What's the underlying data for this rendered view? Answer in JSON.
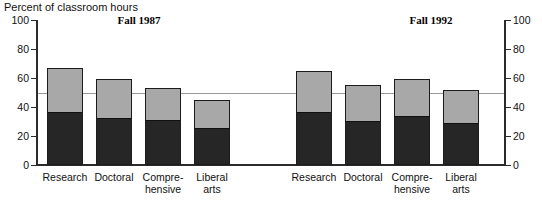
{
  "chart_data": {
    "type": "bar",
    "title": "",
    "subtitle": "",
    "ylabel": "Percent of classroom hours",
    "xlabel": "",
    "ylim": [
      0,
      100
    ],
    "yticks": [
      0,
      20,
      40,
      60,
      80,
      100
    ],
    "ytick_labels": [
      "0",
      "20",
      "40",
      "60",
      "80",
      "100"
    ],
    "gridlines": [
      50
    ],
    "grid": true,
    "dual_axis": true,
    "stacked": true,
    "legend_position": "none",
    "categories": [
      "Research",
      "Doctoral",
      "Compre-\nhensive",
      "Liberal\narts"
    ],
    "panels": [
      {
        "name": "Fall 1987",
        "title": "Fall 1987",
        "series": [
          {
            "name": "lower-segment",
            "color": "#262626",
            "values": [
              36,
              32,
              30,
              25
            ]
          },
          {
            "name": "upper-segment",
            "color": "#a8a8a8",
            "values": [
              31,
              27,
              23,
              20
            ]
          }
        ],
        "totals": [
          67,
          59,
          53,
          45
        ]
      },
      {
        "name": "Fall 1992",
        "title": "Fall 1992",
        "series": [
          {
            "name": "lower-segment",
            "color": "#262626",
            "values": [
              36,
              30,
              33,
              28
            ]
          },
          {
            "name": "upper-segment",
            "color": "#a8a8a8",
            "values": [
              29,
              25,
              26,
              24
            ]
          }
        ],
        "totals": [
          65,
          55,
          59,
          52
        ]
      }
    ],
    "colors": {
      "lower_segment": "#262626",
      "upper_segment": "#a8a8a8",
      "axis": "#2b2b2b",
      "gridline": "#9a9a9a",
      "background": "#ffffff"
    }
  },
  "axis": {
    "title": "Percent of classroom hours",
    "left_ticks": [
      "100",
      "80",
      "60",
      "40",
      "20",
      "0"
    ],
    "right_ticks": [
      "100",
      "80",
      "60",
      "40",
      "20",
      "0"
    ]
  },
  "panels": {
    "left_title": "Fall 1987",
    "right_title": "Fall 1992"
  },
  "categories": {
    "c0": "Research",
    "c1": "Doctoral",
    "c2a": "Compre-",
    "c2b": "hensive",
    "c3a": "Liberal",
    "c3b": "arts"
  }
}
